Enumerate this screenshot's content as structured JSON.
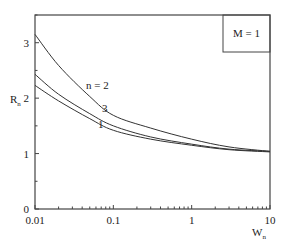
{
  "chart_data": {
    "type": "line",
    "title": "",
    "xlabel": "W",
    "xlabel_sub": "n",
    "ylabel": "R",
    "ylabel_sub": "n",
    "xscale": "log",
    "xlim": [
      0.01,
      10
    ],
    "ylim": [
      0,
      3.5
    ],
    "xticks": [
      0.01,
      0.1,
      1,
      10
    ],
    "xtick_labels": [
      "0.01",
      "0.1",
      "1",
      "10"
    ],
    "yticks": [
      0,
      1,
      2,
      3
    ],
    "ytick_labels": [
      "0",
      "1",
      "2",
      "3"
    ],
    "grid": false,
    "annotation": "M = 1",
    "annotation_position": "top-right",
    "x": [
      0.01,
      0.02,
      0.05,
      0.1,
      0.3,
      1,
      3,
      10
    ],
    "series": [
      {
        "name": "n = 2",
        "label": "n = 2",
        "values": [
          3.15,
          2.59,
          2.03,
          1.69,
          1.46,
          1.26,
          1.12,
          1.04
        ]
      },
      {
        "name": "3",
        "label": "3",
        "values": [
          2.43,
          2.07,
          1.72,
          1.5,
          1.3,
          1.17,
          1.08,
          1.04
        ]
      },
      {
        "name": "1",
        "label": "1",
        "values": [
          2.23,
          1.95,
          1.63,
          1.42,
          1.26,
          1.15,
          1.07,
          1.03
        ]
      }
    ],
    "curve_label_at": [
      0.05,
      0.055,
      0.05
    ]
  }
}
